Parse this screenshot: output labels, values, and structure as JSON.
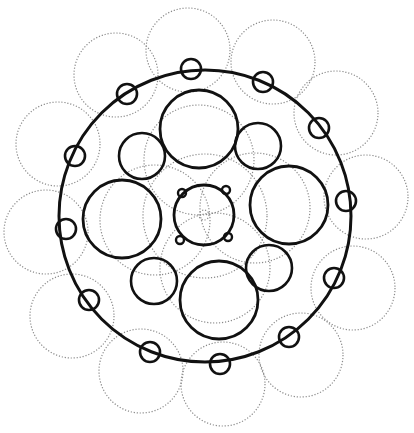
{
  "diagram": {
    "type": "circle-packing-cross-section",
    "colors": {
      "solid_stroke": "#111111",
      "dotted_stroke": "#8a8a8a",
      "background": "#ffffff"
    },
    "outer_ring": {
      "cx": 205,
      "cy": 216,
      "r": 146,
      "stroke_width": 3
    },
    "ring_nodes": {
      "r": 10,
      "stroke_width": 2.6,
      "items": [
        {
          "cx": 191,
          "cy": 69
        },
        {
          "cx": 127,
          "cy": 94
        },
        {
          "cx": 75,
          "cy": 156
        },
        {
          "cx": 66,
          "cy": 229
        },
        {
          "cx": 89,
          "cy": 300
        },
        {
          "cx": 150,
          "cy": 352
        },
        {
          "cx": 220,
          "cy": 364
        },
        {
          "cx": 289,
          "cy": 337
        },
        {
          "cx": 334,
          "cy": 278
        },
        {
          "cx": 346,
          "cy": 201
        },
        {
          "cx": 319,
          "cy": 128
        },
        {
          "cx": 263,
          "cy": 82
        }
      ]
    },
    "dotted_lobes": {
      "r": 42,
      "items": [
        {
          "cx": 188,
          "cy": 50
        },
        {
          "cx": 116,
          "cy": 75
        },
        {
          "cx": 58,
          "cy": 144
        },
        {
          "cx": 46,
          "cy": 232
        },
        {
          "cx": 72,
          "cy": 316
        },
        {
          "cx": 141,
          "cy": 371
        },
        {
          "cx": 223,
          "cy": 384
        },
        {
          "cx": 301,
          "cy": 355
        },
        {
          "cx": 353,
          "cy": 288
        },
        {
          "cx": 366,
          "cy": 197
        },
        {
          "cx": 336,
          "cy": 113
        },
        {
          "cx": 273,
          "cy": 62
        }
      ]
    },
    "large_circles": {
      "r": 39,
      "stroke_width": 2.8,
      "items": [
        {
          "name": "top",
          "cx": 199,
          "cy": 129
        },
        {
          "name": "right",
          "cx": 289,
          "cy": 205
        },
        {
          "name": "bottom",
          "cx": 219,
          "cy": 300
        },
        {
          "name": "left",
          "cx": 122,
          "cy": 219
        }
      ]
    },
    "medium_circles": {
      "r": 23,
      "stroke_width": 2.6,
      "items": [
        {
          "name": "upper-left",
          "cx": 142,
          "cy": 156
        },
        {
          "name": "upper-right",
          "cx": 258,
          "cy": 146
        },
        {
          "name": "lower-right",
          "cx": 269,
          "cy": 268
        },
        {
          "name": "lower-left",
          "cx": 154,
          "cy": 281
        }
      ]
    },
    "inner_dotted_arcs": {
      "items": [
        {
          "cx": 199,
          "cy": 160,
          "r": 55
        },
        {
          "cx": 255,
          "cy": 208,
          "r": 55
        },
        {
          "cx": 215,
          "cy": 268,
          "r": 55
        },
        {
          "cx": 155,
          "cy": 220,
          "r": 55
        },
        {
          "cx": 205,
          "cy": 216,
          "r": 62
        }
      ]
    },
    "center_core": {
      "cx": 204,
      "cy": 215,
      "r": 30,
      "stroke_width": 2.8,
      "bumps": [
        {
          "cx": 182,
          "cy": 193
        },
        {
          "cx": 226,
          "cy": 190
        },
        {
          "cx": 228,
          "cy": 237
        },
        {
          "cx": 180,
          "cy": 240
        }
      ],
      "bump_r": 4,
      "inner_dot": {
        "cx": 204,
        "cy": 215,
        "r": 5
      }
    }
  }
}
